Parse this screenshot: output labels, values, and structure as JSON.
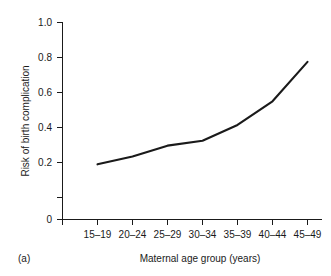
{
  "chart_data": {
    "type": "line",
    "title": "",
    "subtitle": "",
    "panel_label": "(a)",
    "xlabel": "Maternal age group (years)",
    "ylabel": "Risk of birth complication",
    "categories": [
      "15–19",
      "20–24",
      "25–29",
      "30–34",
      "35–39",
      "40–44",
      "45–49"
    ],
    "values": [
      0.28,
      0.32,
      0.375,
      0.4,
      0.48,
      0.6,
      0.8
    ],
    "series": [
      {
        "name": "Risk of birth complication",
        "values": [
          0.28,
          0.32,
          0.375,
          0.4,
          0.48,
          0.6,
          0.8
        ]
      }
    ],
    "ylim": [
      0,
      1.0
    ],
    "ytick_values": [
      0,
      0.2,
      0.4,
      0.6,
      0.8,
      1.0
    ],
    "ytick_labels": [
      "0",
      "0.2",
      "0.4",
      "0.6",
      "0.8",
      "1.0"
    ],
    "xtick_labels": [
      "15–19",
      "20–24",
      "25–29",
      "30–34",
      "35–39",
      "40–44",
      "45–49"
    ],
    "grid": false,
    "legend": false,
    "legend_position": "none",
    "line_color": "#1a1a1a",
    "background_color": "#ffffff"
  }
}
